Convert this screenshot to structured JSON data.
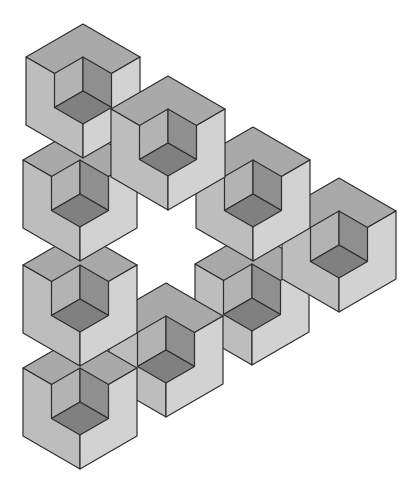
{
  "figure": {
    "cube_count": 9,
    "cube_geometry": {
      "half_width": 57,
      "rise": 33,
      "side_height": 68
    },
    "colors": {
      "top": "#a9a9a9",
      "left_face": "#bdbdbd",
      "right_face": "#d2d2d2",
      "cut_left_wall": "#b3b3b3",
      "cut_right_wall": "#8f8f8f",
      "cut_floor": "#808080",
      "edge": "#2e2e2e"
    },
    "cubes": [
      {
        "id": "cube-bottom-diagonal-2",
        "cx": 252,
        "y": 231
      },
      {
        "id": "cube-right-corner",
        "cx": 339,
        "y": 178
      },
      {
        "id": "cube-top-diagonal-3",
        "cx": 253,
        "y": 127
      },
      {
        "id": "cube-bottom-diagonal-1",
        "cx": 166,
        "y": 283
      },
      {
        "id": "cube-bottom-left-corner",
        "cx": 80,
        "y": 335
      },
      {
        "id": "cube-left-column-3",
        "cx": 80,
        "y": 232
      },
      {
        "id": "cube-left-column-2",
        "cx": 80,
        "y": 127
      },
      {
        "id": "cube-top-corner",
        "cx": 83,
        "y": 24
      },
      {
        "id": "cube-top-diagonal-2",
        "cx": 168,
        "y": 76
      }
    ]
  }
}
